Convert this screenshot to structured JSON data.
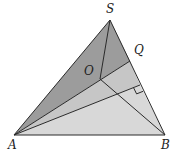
{
  "diagram": {
    "title": "",
    "points": {
      "S": {
        "label": "S",
        "x": 110,
        "y": 20,
        "lx": 106,
        "ly": 13
      },
      "A": {
        "label": "A",
        "x": 14,
        "y": 135,
        "lx": 8,
        "ly": 149
      },
      "B": {
        "label": "B",
        "x": 165,
        "y": 135,
        "lx": 161,
        "ly": 149
      },
      "Q": {
        "label": "Q",
        "x": 130,
        "y": 61,
        "lx": 134,
        "ly": 54
      },
      "O": {
        "label": "O",
        "x": 100,
        "y": 79,
        "lx": 84,
        "ly": 75
      },
      "F": {
        "label": "",
        "x": 140,
        "y": 85
      }
    },
    "labels": {
      "S": "S",
      "A": "A",
      "B": "B",
      "Q": "Q",
      "O": "O"
    },
    "colors": {
      "dark_region": "#9c9c9c",
      "medium_region": "#c6c6c6",
      "light_region": "#d8d8d8",
      "stroke": "#2a2a2a"
    },
    "regions": [
      {
        "name": "face-SAQ",
        "points": "110,20 14,135 130,61"
      },
      {
        "name": "face-AQF",
        "points": "14,135 130,61 140,85"
      },
      {
        "name": "face-AFB",
        "points": "14,135 140,85 165,135"
      }
    ],
    "segments": [
      {
        "name": "edge-SA",
        "from": "S",
        "to": "A"
      },
      {
        "name": "edge-SB",
        "from": "S",
        "to": "B"
      },
      {
        "name": "edge-AB",
        "from": "A",
        "to": "B"
      },
      {
        "name": "segment-AQ",
        "from": "A",
        "to": "Q"
      },
      {
        "name": "segment-SO",
        "from": "S",
        "to": "O"
      },
      {
        "name": "segment-OB",
        "from": "O",
        "to": "B"
      },
      {
        "name": "segment-AF",
        "from": "A",
        "to": "F"
      }
    ],
    "right_angle_marker": {
      "at": "F",
      "size": 7
    }
  }
}
